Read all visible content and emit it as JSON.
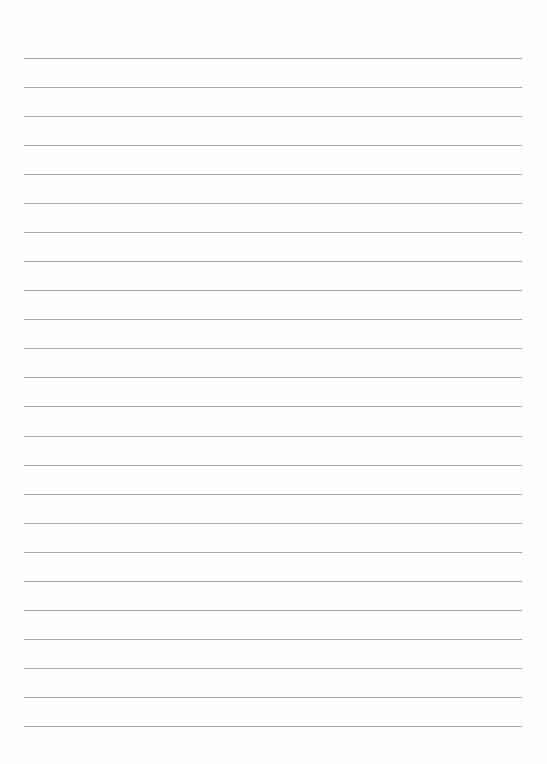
{
  "page": {
    "type": "ruled-paper",
    "line_count": 24,
    "first_line_y": 58,
    "line_spacing": 29.04,
    "line_left": 24,
    "line_right": 522,
    "line_color": "#a8a8a8",
    "background": "#fefefe"
  }
}
